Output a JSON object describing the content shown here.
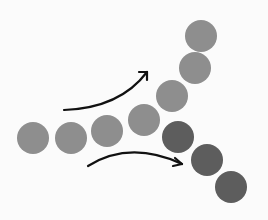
{
  "diagram": {
    "background": "#fbfbfb",
    "colors": {
      "light_circle": "#8e8e8e",
      "dark_circle": "#5d5d5d",
      "arrow": "#111111"
    },
    "circle_radius": 16,
    "circles": [
      {
        "id": "stem-1",
        "cx": 33,
        "cy": 138,
        "tone": "light"
      },
      {
        "id": "stem-2",
        "cx": 71,
        "cy": 138,
        "tone": "light"
      },
      {
        "id": "stem-3",
        "cx": 107,
        "cy": 131,
        "tone": "light"
      },
      {
        "id": "stem-4",
        "cx": 144,
        "cy": 120,
        "tone": "light"
      },
      {
        "id": "upper-1",
        "cx": 172,
        "cy": 96,
        "tone": "light"
      },
      {
        "id": "upper-2",
        "cx": 195,
        "cy": 68,
        "tone": "light"
      },
      {
        "id": "upper-3",
        "cx": 201,
        "cy": 36,
        "tone": "light"
      },
      {
        "id": "lower-1",
        "cx": 178,
        "cy": 137,
        "tone": "dark"
      },
      {
        "id": "lower-2",
        "cx": 207,
        "cy": 160,
        "tone": "dark"
      },
      {
        "id": "lower-3",
        "cx": 231,
        "cy": 187,
        "tone": "dark"
      }
    ],
    "arrows": [
      {
        "id": "arrow-up",
        "path": "M64 110 Q 120 108 147 72",
        "head_x": 147,
        "head_y": 72,
        "direction": "up-right"
      },
      {
        "id": "arrow-down",
        "path": "M88 166 Q 130 140 182 164",
        "head_x": 182,
        "head_y": 164,
        "direction": "right-down"
      }
    ]
  }
}
